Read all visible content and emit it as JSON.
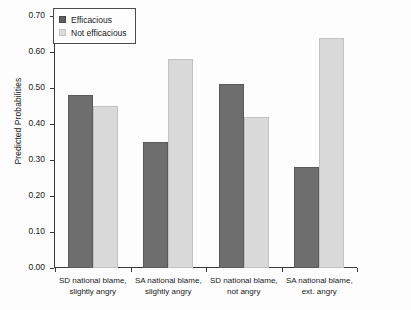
{
  "chart_data": {
    "type": "bar",
    "title": "",
    "xlabel": "",
    "ylabel": "Predicted Probabilities",
    "ylim": [
      0.0,
      0.7
    ],
    "ytick_labels": [
      "0.00",
      "0.10",
      "0.20",
      "0.30",
      "0.40",
      "0.50",
      "0.60",
      "0.70"
    ],
    "ytick_values": [
      0.0,
      0.1,
      0.2,
      0.3,
      0.4,
      0.5,
      0.6,
      0.7
    ],
    "grid": false,
    "legend_position": "top-left",
    "categories": [
      "SD national blame, slightly angry",
      "SA national blame, slightly angry",
      "SD national blame, not angry",
      "SA national blame, ext. angry"
    ],
    "categories_lines": [
      [
        "SD national blame,",
        "slightly angry"
      ],
      [
        "SA national blame,",
        "slightly angry"
      ],
      [
        "SD national blame,",
        "not angry"
      ],
      [
        "SA national blame,",
        "ext. angry"
      ]
    ],
    "series": [
      {
        "name": "Efficacious",
        "color": "#6e6e6e",
        "values": [
          0.48,
          0.35,
          0.51,
          0.28
        ]
      },
      {
        "name": "Not efficacious",
        "color": "#d9d9d9",
        "values": [
          0.45,
          0.58,
          0.42,
          0.64
        ]
      }
    ]
  },
  "legend": {
    "items": [
      {
        "label": "Efficacious"
      },
      {
        "label": "Not efficacious"
      }
    ]
  },
  "axis": {
    "y_title": "Predicted Probabilities"
  }
}
